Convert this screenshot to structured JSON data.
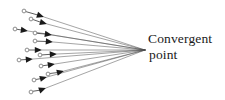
{
  "figure": {
    "title": "",
    "background_color": "#ffffff",
    "line_color": "#4d4d4d",
    "arrowhead_color": "#1a1a1a",
    "tail_marker_color": "#8c8c8c",
    "label": {
      "line1": "Convergent",
      "line2": "point"
    },
    "convergent_point": {
      "x": 145,
      "y": 50
    },
    "arrow_count": 12,
    "arrows": [
      {
        "id": 1,
        "tail_x": 24,
        "tail_y": 11,
        "head_x": 44,
        "head_y": 17
      },
      {
        "id": 2,
        "tail_x": 31,
        "tail_y": 19,
        "head_x": 47,
        "head_y": 24
      },
      {
        "id": 3,
        "tail_x": 15,
        "tail_y": 29,
        "head_x": 28,
        "head_y": 31
      },
      {
        "id": 4,
        "tail_x": 35,
        "tail_y": 33,
        "head_x": 52,
        "head_y": 35
      },
      {
        "id": 5,
        "tail_x": 35,
        "tail_y": 41,
        "head_x": 53,
        "head_y": 42
      },
      {
        "id": 6,
        "tail_x": 27,
        "tail_y": 50,
        "head_x": 42,
        "head_y": 50
      },
      {
        "id": 7,
        "tail_x": 19,
        "tail_y": 60,
        "head_x": 33,
        "head_y": 59
      },
      {
        "id": 8,
        "tail_x": 40,
        "tail_y": 55,
        "head_x": 57,
        "head_y": 54
      },
      {
        "id": 9,
        "tail_x": 41,
        "tail_y": 66,
        "head_x": 55,
        "head_y": 64
      },
      {
        "id": 10,
        "tail_x": 48,
        "tail_y": 74,
        "head_x": 64,
        "head_y": 71
      },
      {
        "id": 11,
        "tail_x": 34,
        "tail_y": 80,
        "head_x": 47,
        "head_y": 77
      },
      {
        "id": 12,
        "tail_x": 31,
        "tail_y": 92,
        "head_x": 46,
        "head_y": 88
      }
    ]
  }
}
